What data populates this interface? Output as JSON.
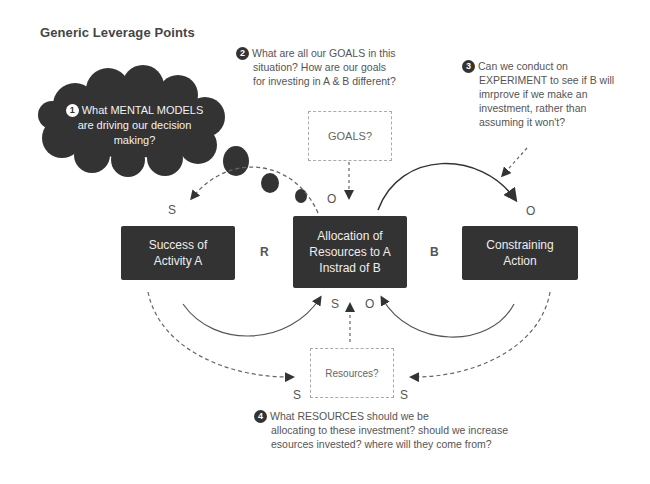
{
  "title": "Generic Leverage Points",
  "leverage_points": [
    {
      "number": "1",
      "text_lines": [
        "What MENTAL MODELS",
        "are driving our decision",
        "making?"
      ]
    },
    {
      "number": "2",
      "text_lines": [
        "What are all our GOALS in this",
        "situation? How are our goals",
        "for investing in A & B different?"
      ]
    },
    {
      "number": "3",
      "text_lines": [
        "Can we conduct on",
        "EXPERIMENT to see if B will",
        "imrprove if we make an",
        "investment, rather than",
        "assuming it won't?"
      ]
    },
    {
      "number": "4",
      "text_lines": [
        "What RESOURCES should we be",
        "allocating to these investment? should we increase",
        "esources invested? where will they come from?"
      ]
    }
  ],
  "nodes": {
    "success_a": {
      "lines": [
        "Success of",
        "Activity A"
      ]
    },
    "allocation": {
      "lines": [
        "Allocation of",
        "Resources to A",
        "Instrad of B"
      ]
    },
    "constraining": {
      "lines": [
        "Constraining",
        "Action"
      ]
    },
    "goals": {
      "label": "GOALS?"
    },
    "resources": {
      "label": "Resources?"
    }
  },
  "loops": {
    "reinforcing": "R",
    "balancing": "B"
  },
  "polarities": {
    "success_a_top": "S",
    "allocation_top": "O",
    "constraining_top": "O",
    "allocation_bottom_left": "S",
    "allocation_bottom_right": "O",
    "resources_left": "S",
    "resources_right": "S"
  },
  "colors": {
    "node_fill": "#333333",
    "text": "#555555",
    "dashed": "#888888",
    "background": "#ffffff"
  }
}
